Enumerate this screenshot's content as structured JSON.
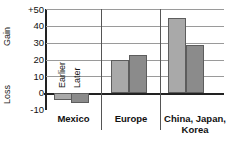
{
  "chart_data": {
    "type": "bar",
    "title": "",
    "subtitle": "",
    "xlabel": "",
    "ylabel": "Gain / Loss",
    "axis_top_label": "Gain",
    "axis_bottom_label": "Loss",
    "categories": [
      "Mexico",
      "Europe",
      "China, Japan, Korea"
    ],
    "series": [
      {
        "name": "Earlier",
        "values": [
          -4,
          19.5,
          44.5
        ]
      },
      {
        "name": "Later",
        "values": [
          -6,
          22.5,
          28.5
        ]
      }
    ],
    "ylim": [
      -10,
      50
    ],
    "yticks": [
      50,
      40,
      30,
      20,
      10,
      0,
      -10
    ],
    "ytick_labels": [
      "+50",
      "40",
      "30",
      "20",
      "10",
      "0",
      "-10"
    ],
    "grid": true,
    "grid_axis": "y",
    "legend": "inline-rotated-in-plot",
    "legend_entries": [
      "Earlier",
      "Later"
    ],
    "colors": {
      "earlier": "#a9a9a9",
      "later": "#8b8b8b",
      "bar_outline": "#5d5d5d",
      "gridline": "#9a9a9a",
      "axis": "#222222",
      "separator": "#555555",
      "text": "#111111",
      "background": "#ffffff"
    },
    "category_separators": true,
    "group_count": 3,
    "series_count": 2
  },
  "labels": {
    "gain": "Gain",
    "loss": "Loss",
    "ytick_50": "+50",
    "ytick_40": "40",
    "ytick_30": "30",
    "ytick_20": "20",
    "ytick_10": "10",
    "ytick_0": "0",
    "ytick_neg10": "-10",
    "series_earlier": "Earlier",
    "series_later": "Later",
    "cat_mexico": "Mexico",
    "cat_europe": "Europe",
    "cat_cjk_line1": "China, Japan,",
    "cat_cjk_line2": "Korea"
  }
}
